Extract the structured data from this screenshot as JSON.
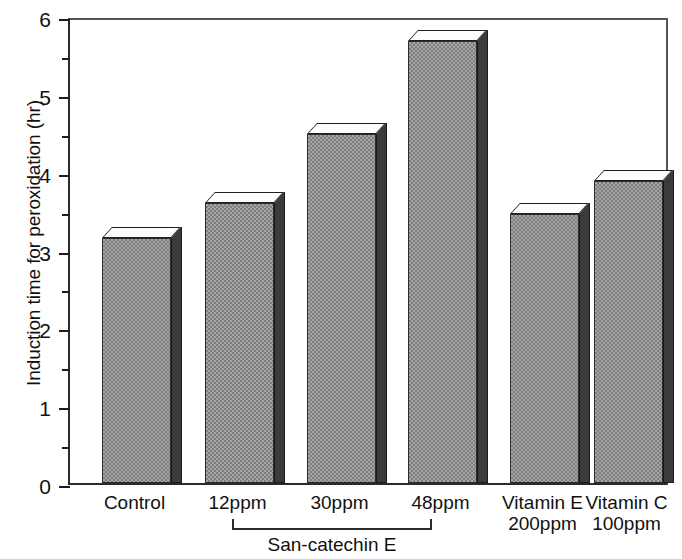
{
  "chart_data": {
    "type": "bar",
    "title": "",
    "xlabel": "",
    "ylabel": "Induction time for peroxidation (hr)",
    "categories": [
      "Control",
      "12ppm",
      "30ppm",
      "48ppm",
      "Vitamin E\n200ppm",
      "Vitamin C\n100ppm"
    ],
    "values": [
      3.15,
      3.6,
      4.48,
      5.68,
      3.45,
      3.88
    ],
    "ylim": [
      0,
      6
    ],
    "ytick_labels": [
      "0",
      "1",
      "2",
      "3",
      "4",
      "5",
      "6"
    ],
    "ytick_values": [
      0,
      1,
      2,
      3,
      4,
      5,
      6
    ],
    "yminor_values": [
      0.5,
      1.5,
      2.5,
      3.5,
      4.5,
      5.5
    ],
    "grid": false,
    "legend": "none",
    "group_bracket_label": "San-catechin E",
    "group_bracket_categories": [
      "12ppm",
      "30ppm",
      "48ppm"
    ],
    "series": [
      {
        "name": "Induction time for peroxidation (hr)",
        "values": [
          3.15,
          3.6,
          4.48,
          5.68,
          3.45,
          3.88
        ]
      }
    ],
    "bar_style": "3d-block",
    "bar_fill_color": "#a6a6a6",
    "bar_side_color": "#3b3b3b",
    "bar_top_color": "#fdfdfd",
    "axis_color": "#1d1d1d"
  }
}
